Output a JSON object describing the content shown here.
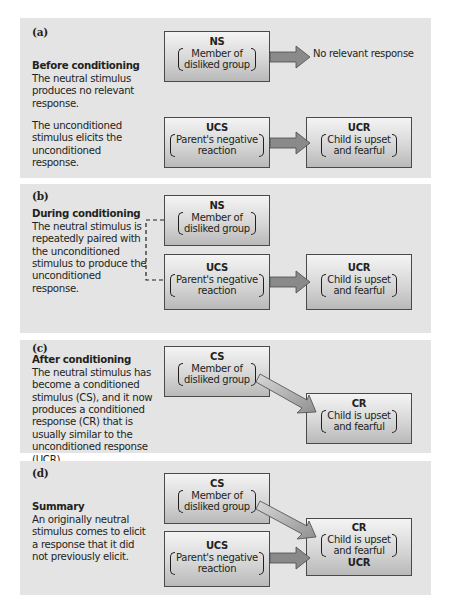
{
  "colors": {
    "panel_bg": "#e4e4e4",
    "box_border": "#4a4a4a",
    "arrow_fill": "#8a8a8a",
    "arrow_fill_light": "#c8c8c8"
  },
  "panels": [
    {
      "label": "(a)",
      "title": "Before conditioning",
      "text1": "The neutral stimulus produces no relevant response.",
      "text2": "The unconditioned stimulus elicits the unconditioned response.",
      "boxes": {
        "ns": {
          "abbr": "NS",
          "line1": "Member of",
          "line2": "disliked group"
        },
        "ucs": {
          "abbr": "UCS",
          "line1": "Parent's negative",
          "line2": "reaction"
        },
        "ucr": {
          "abbr": "UCR",
          "line1": "Child is upset",
          "line2": "and fearful"
        }
      },
      "no_response": "No relevant response"
    },
    {
      "label": "(b)",
      "title": "During conditioning",
      "text1": "The neutral stimulus is repeatedly paired with the unconditioned stimulus to produce the unconditioned response.",
      "boxes": {
        "ns": {
          "abbr": "NS",
          "line1": "Member of",
          "line2": "disliked group"
        },
        "ucs": {
          "abbr": "UCS",
          "line1": "Parent's negative",
          "line2": "reaction"
        },
        "ucr": {
          "abbr": "UCR",
          "line1": "Child is upset",
          "line2": "and fearful"
        }
      }
    },
    {
      "label": "(c)",
      "title": "After conditioning",
      "text1": "The neutral stimulus has become a conditioned stimulus (CS), and it now produces a conditioned response (CR) that is usually similar to the unconditioned response (UCR).",
      "boxes": {
        "cs": {
          "abbr": "CS",
          "line1": "Member of",
          "line2": "disliked group"
        },
        "cr": {
          "abbr": "CR",
          "line1": "Child is upset",
          "line2": "and fearful"
        }
      }
    },
    {
      "label": "(d)",
      "title": "Summary",
      "text1": "An originally neutral stimulus comes to elicit a response that it did not previously elicit.",
      "boxes": {
        "cs": {
          "abbr": "CS",
          "line1": "Member of",
          "line2": "disliked group"
        },
        "ucs": {
          "abbr": "UCS",
          "line1": "Parent's negative",
          "line2": "reaction"
        },
        "cr": {
          "abbr": "CR",
          "line1": "Child is upset",
          "line2": "and fearful",
          "extra": "UCR"
        }
      }
    }
  ]
}
